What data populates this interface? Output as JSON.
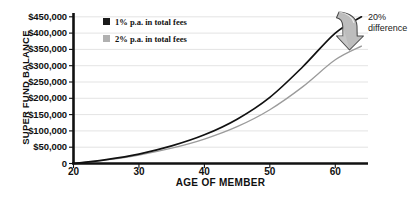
{
  "chart_data": {
    "type": "line",
    "title": "",
    "xlabel": "AGE OF MEMBER",
    "ylabel": "SUPER FUND BALANCE",
    "xlim": [
      20,
      65
    ],
    "ylim": [
      0,
      450000
    ],
    "grid": true,
    "legend_position": "top-left-inside",
    "xticks": [
      20,
      30,
      40,
      50,
      60
    ],
    "xtick_labels": [
      "20",
      "30",
      "40",
      "50",
      "60"
    ],
    "yticks": [
      0,
      50000,
      100000,
      150000,
      200000,
      250000,
      300000,
      350000,
      400000,
      450000
    ],
    "ytick_labels": [
      "0",
      "$50,000",
      "$100,000",
      "$150,000",
      "$200,000",
      "$250,000",
      "$300,000",
      "$350,000",
      "$400,000",
      "$450,000"
    ],
    "x": [
      20,
      25,
      30,
      35,
      40,
      45,
      50,
      55,
      60,
      64
    ],
    "series": [
      {
        "name": "1% p.a. in total fees",
        "color": "#111111",
        "values": [
          0,
          12000,
          29000,
          54000,
          88000,
          136000,
          203000,
          296000,
          400000,
          450000
        ]
      },
      {
        "name": "2% p.a. in total fees",
        "color": "#9b9b9b",
        "values": [
          0,
          11000,
          26000,
          47000,
          75000,
          113000,
          165000,
          235000,
          318000,
          360000
        ]
      }
    ],
    "annotations": [
      {
        "name": "difference-callout",
        "line1": "20%",
        "line2": "difference",
        "arrow": "curved-down-arrow",
        "arrow_color": "#b5b5b5"
      }
    ]
  },
  "legend": {
    "items": [
      {
        "label": "1% p.a. in total fees",
        "color": "#1a1a1a"
      },
      {
        "label": "2% p.a. in total fees",
        "color": "#b0b0b0"
      }
    ]
  },
  "axes": {
    "y_title": "SUPER FUND BALANCE",
    "x_title": "AGE OF MEMBER"
  },
  "annotation": {
    "line1": "20%",
    "line2": "difference"
  },
  "colors": {
    "axis": "#111111",
    "grid": "#d8d8d8",
    "series_1pct": "#111111",
    "series_2pct": "#9b9b9b",
    "arrow_fill": "#b8b8b8",
    "arrow_stroke": "#5a5a5a"
  }
}
